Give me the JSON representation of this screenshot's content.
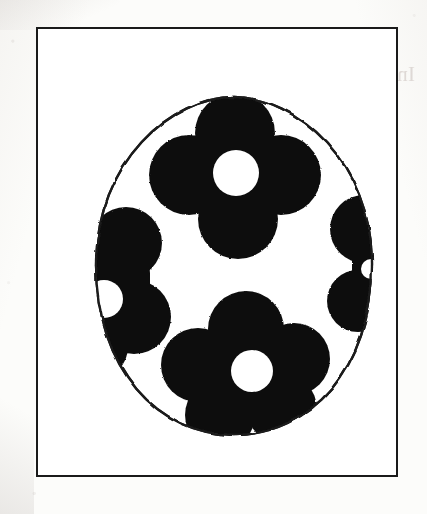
{
  "document": {
    "kind": "photocopied-worksheet",
    "title": "Decorated Easter Egg Template",
    "caption": ""
  },
  "bleed_through": {
    "note": "faint mirrored show-through text from the reverse side of the sheet",
    "line1": "Group size:",
    "line2": "Individual or small group",
    "color": "#cfc6c2"
  },
  "frame": {
    "border_color": "#1a1a1a",
    "fill_color": "#ffffff",
    "x": 36,
    "y": 27,
    "width": 362,
    "height": 450
  },
  "artwork": {
    "name": "easter-egg-with-flowers",
    "outline_color": "#1a1a1a",
    "fill_color": "#ffffff",
    "motif_color": "#111111",
    "motif_center_color": "#ffffff",
    "egg": {
      "cx": 196,
      "cy": 237,
      "rx": 138,
      "ry": 169
    },
    "flowers": [
      {
        "name": "flower-top",
        "cx": 197,
        "cy": 142,
        "petals": 4,
        "petal_r": 40,
        "center_r": 23,
        "clipped": false
      },
      {
        "name": "flower-left",
        "cx": 75,
        "cy": 250,
        "petals": 4,
        "petal_r": 36,
        "center_r": 19,
        "clipped": true
      },
      {
        "name": "flower-right",
        "cx": 320,
        "cy": 232,
        "petals": 4,
        "petal_r": 34,
        "center_r": 17,
        "clipped": true
      },
      {
        "name": "flower-bottom",
        "cx": 211,
        "cy": 338,
        "petals": 5,
        "petal_r": 38,
        "center_r": 21,
        "clipped": false
      }
    ]
  }
}
